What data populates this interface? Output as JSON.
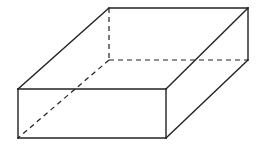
{
  "figure": {
    "title": "",
    "colors": {
      "line": "#222222",
      "background": "#ffffff"
    },
    "vertices": {
      "front_bottom_left": [
        18,
        138
      ],
      "front_top_left": [
        18,
        89
      ],
      "front_top_right": [
        166,
        89
      ],
      "front_bottom_right": [
        166,
        138
      ],
      "back_top_left": [
        109,
        8
      ],
      "back_top_right": [
        248,
        8
      ],
      "back_bottom_right": [
        248,
        60
      ],
      "back_bottom_left": [
        109,
        60
      ]
    },
    "visible_edges": [
      [
        "front_bottom_left",
        "front_top_left"
      ],
      [
        "front_top_left",
        "front_top_right"
      ],
      [
        "front_top_right",
        "front_bottom_right"
      ],
      [
        "front_bottom_right",
        "front_bottom_left"
      ],
      [
        "front_top_left",
        "back_top_left"
      ],
      [
        "back_top_left",
        "back_top_right"
      ],
      [
        "back_top_right",
        "front_top_right"
      ],
      [
        "back_top_right",
        "back_bottom_right"
      ],
      [
        "back_bottom_right",
        "front_bottom_right"
      ]
    ],
    "hidden_edges": [
      [
        "back_top_left",
        "back_bottom_left"
      ],
      [
        "back_bottom_left",
        "back_bottom_right"
      ],
      [
        "back_bottom_left",
        "front_bottom_left"
      ]
    ]
  }
}
